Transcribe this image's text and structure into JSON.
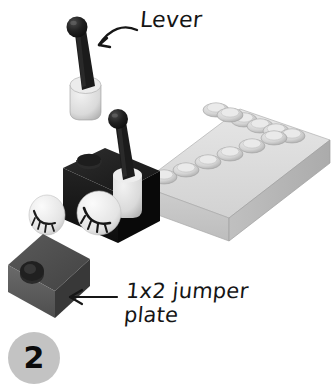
{
  "page": {
    "background_color": "#ffffff"
  },
  "step": {
    "number": "2",
    "badge_color": "#c3c3c3",
    "badge_text_color": "#0b0b0b"
  },
  "callouts": [
    {
      "id": "lever",
      "label": "Lever",
      "arrow": "curved-arrow-down-left",
      "text_color": "#151515"
    },
    {
      "id": "jumper",
      "label_line_1": "1x2 jumper",
      "label_line_2": "plate",
      "label": "1x2 jumper\nplate",
      "arrow": "straight-arrow-left",
      "text_color": "#151515"
    }
  ],
  "parts": [
    {
      "id": "lever-loose",
      "name": "lever antenna piece",
      "description": "black antenna with ball top on light gray rounded base",
      "colors": {
        "stem": "#1c1c1c",
        "ball": "#141414",
        "base": "#d9d9d9"
      }
    },
    {
      "id": "eye-tile-loose",
      "name": "eye tile with eyelashes",
      "description": "white round tile printed with closed eye and eyelashes",
      "colors": {
        "tile": "#e8e8e8",
        "lashes": "#1a1a1a"
      }
    },
    {
      "id": "jumper-plate",
      "name": "1x2 jumper plate",
      "description": "dark gray 1x2 plate with single center stud",
      "colors": {
        "top": "#4a4a4a",
        "front": "#5c5c5c",
        "side": "#3a3a3a",
        "stud": "#2e2e2e"
      }
    },
    {
      "id": "black-bracket-brick",
      "name": "black bracket brick assembly",
      "description": "black brick holding eye tile and lever",
      "colors": {
        "body": "#1a1a1a",
        "top": "#262626"
      }
    },
    {
      "id": "gray-brick-2x6",
      "name": "light gray 2x6 brick",
      "description": "light bluish gray brick shown in isometric view with 12 studs",
      "studs_rows": 2,
      "studs_per_row": 6,
      "colors": {
        "top": "#dcdcdc",
        "front": "#c4c4c4",
        "side": "#b4b4b4",
        "stud": "#d0d0d0"
      }
    }
  ]
}
